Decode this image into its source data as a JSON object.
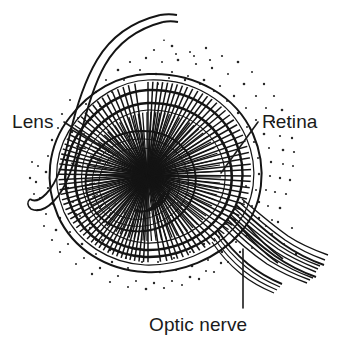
{
  "figure": {
    "background_color": "#ffffff",
    "ink_color": "#141414",
    "width": 353,
    "height": 340,
    "style": "pen-and-ink line drawing with stipple shading"
  },
  "labels": {
    "lens": {
      "text": "Lens",
      "x": 12,
      "y": 128,
      "anchor": "start",
      "leader_from": [
        64,
        122
      ],
      "leader_to": [
        127,
        163
      ]
    },
    "retina": {
      "text": "Retina",
      "x": 262,
      "y": 128,
      "anchor": "start",
      "leader_from": [
        258,
        122
      ],
      "leader_to": [
        221,
        173
      ]
    },
    "optic_nerve": {
      "text": "Optic nerve",
      "x": 149,
      "y": 331,
      "anchor": "start",
      "leader_from": [
        243,
        249
      ],
      "leader_to": [
        243,
        308
      ]
    }
  },
  "structures": [
    {
      "name": "eyelid-strip",
      "description": "double-line band curving over the top left and hooking down"
    },
    {
      "name": "sclera-outer-wall",
      "description": "outer eyeball boundary"
    },
    {
      "name": "retina-layer",
      "description": "dense radially hatched band inside the sclera"
    },
    {
      "name": "choroid-ring",
      "description": "dark concentric ring between retina and lens"
    },
    {
      "name": "iris-ring",
      "description": "hatched ring around the lens"
    },
    {
      "name": "lens",
      "description": "central clear lens with fine concentric hatching"
    },
    {
      "name": "optic-nerve-bundle",
      "description": "sheaf of parallel curved fibers exiting lower right"
    },
    {
      "name": "stipple-field",
      "description": "dotted orbital tissue surrounding the eyeball"
    }
  ]
}
